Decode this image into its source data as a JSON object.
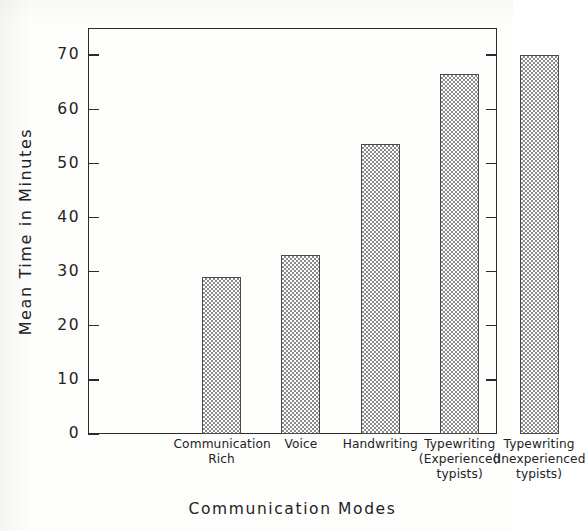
{
  "chart_data": {
    "type": "bar",
    "title": "",
    "xlabel": "Communication Modes",
    "ylabel": "Mean Time in Minutes",
    "ylim": [
      0,
      75
    ],
    "yticks": [
      0,
      10,
      20,
      30,
      40,
      50,
      60,
      70
    ],
    "ytick_labels": [
      "0",
      "10",
      "20",
      "30",
      "40",
      "50",
      "60",
      "70"
    ],
    "grid": false,
    "legend": false,
    "categories": [
      "Communication Rich",
      "Voice",
      "Handwriting",
      "Typewriting (Experienced typists)",
      "Typewriting (Inexperienced typists)"
    ],
    "category_lines": [
      [
        "Communication",
        "Rich",
        ""
      ],
      [
        "Voice",
        "",
        ""
      ],
      [
        "Handwriting",
        "",
        ""
      ],
      [
        "Typewriting",
        "(Experienced",
        "typists)"
      ],
      [
        "Typewriting",
        "(Inexperienced",
        "typists)"
      ]
    ],
    "values": [
      29,
      33,
      53.5,
      66.5,
      70
    ],
    "bar_fill": "crosshatch",
    "bar_color": "#8a8a8a",
    "bar_edge_color": "#4a4a4a",
    "axis_color": "#2b2b2b",
    "background": "#fdfdfc"
  }
}
